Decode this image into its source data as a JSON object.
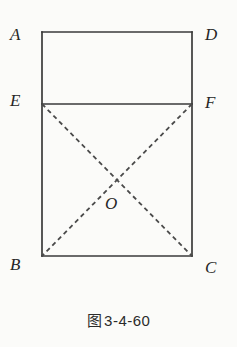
{
  "figure": {
    "caption_cjk": "图",
    "caption_number": "3-4-60",
    "caption_full": "图 3-4-60",
    "background_color": "#fbfbf9",
    "stroke_color": "#3a3a3a",
    "dash_color": "#4a4a4a",
    "label_color": "#262626"
  },
  "geometry": {
    "type": "plane-geometry-diagram",
    "shape": "rectangle-with-midline-and-diagonals",
    "rectangle": {
      "left": 42,
      "right": 192,
      "top": 32,
      "bottom": 256,
      "width": 150,
      "height": 224
    },
    "points": [
      {
        "id": "A",
        "x": 42,
        "y": 32,
        "label": "A",
        "label_x": 10,
        "label_y": 26,
        "on_figure": "top-left-corner"
      },
      {
        "id": "D",
        "x": 192,
        "y": 32,
        "label": "D",
        "label_x": 205,
        "label_y": 26,
        "on_figure": "top-right-corner"
      },
      {
        "id": "E",
        "x": 42,
        "y": 104,
        "label": "E",
        "label_x": 10,
        "label_y": 92,
        "on_figure": "left-side-point"
      },
      {
        "id": "F",
        "x": 192,
        "y": 104,
        "label": "F",
        "label_x": 205,
        "label_y": 94,
        "on_figure": "right-side-point"
      },
      {
        "id": "B",
        "x": 42,
        "y": 256,
        "label": "B",
        "label_x": 10,
        "label_y": 256,
        "on_figure": "bottom-left-corner"
      },
      {
        "id": "C",
        "x": 192,
        "y": 256,
        "label": "C",
        "label_x": 205,
        "label_y": 259,
        "on_figure": "bottom-right-corner"
      },
      {
        "id": "O",
        "x": 117,
        "y": 180,
        "label": "O",
        "label_x": 105,
        "label_y": 195,
        "on_figure": "diagonal-intersection"
      }
    ],
    "solid_segments": [
      {
        "id": "AD",
        "from": "A",
        "to": "D",
        "style": "solid"
      },
      {
        "id": "AE",
        "from": "A",
        "to": "E",
        "style": "solid"
      },
      {
        "id": "DF",
        "from": "D",
        "to": "F",
        "style": "solid"
      },
      {
        "id": "EF",
        "from": "E",
        "to": "F",
        "style": "solid"
      },
      {
        "id": "EB",
        "from": "E",
        "to": "B",
        "style": "solid"
      },
      {
        "id": "FC",
        "from": "F",
        "to": "C",
        "style": "solid"
      },
      {
        "id": "BC",
        "from": "B",
        "to": "C",
        "style": "solid"
      }
    ],
    "dashed_segments": [
      {
        "id": "EC",
        "from": "E",
        "to": "C",
        "style": "dashed"
      },
      {
        "id": "FB",
        "from": "F",
        "to": "B",
        "style": "dashed"
      }
    ]
  }
}
